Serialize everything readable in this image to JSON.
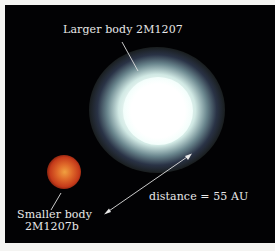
{
  "figure": {
    "background_color": "#020204",
    "border_color": "#f4f4f2",
    "larger_body": {
      "label": "Larger body 2M1207",
      "color": "#ffffff"
    },
    "smaller_body": {
      "label_line1": "Smaller body",
      "label_line2": "2M1207b",
      "color": "#d9542a"
    },
    "distance": {
      "label": "distance = 55 AU"
    }
  }
}
